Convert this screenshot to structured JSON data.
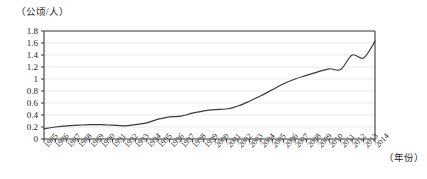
{
  "chart_data": {
    "type": "line",
    "title": "",
    "subtitle": "",
    "ylabel": "（公顷/人）",
    "xlabel": "（年份）",
    "ylim": [
      0,
      1.8
    ],
    "ytick_labels": [
      "0",
      "0.2",
      "0.4",
      "0.6",
      "0.8",
      "1",
      "1.2",
      "1.4",
      "1.6",
      "1.8"
    ],
    "ytick_values": [
      0,
      0.2,
      0.4,
      0.6,
      0.8,
      1.0,
      1.2,
      1.4,
      1.6,
      1.8
    ],
    "grid": true,
    "legend": "none",
    "categories": [
      "1985",
      "1986",
      "1987",
      "1988",
      "1989",
      "1990",
      "1991",
      "1992",
      "1993",
      "1994",
      "1995",
      "1996",
      "1997",
      "1998",
      "1999",
      "2000",
      "2001",
      "2002",
      "2003",
      "2004",
      "2005",
      "2006",
      "2007",
      "2008",
      "2009",
      "2010",
      "2011",
      "2012",
      "2013",
      "2014"
    ],
    "series": [
      {
        "name": "人均建设用地",
        "color": "#3a3a3a",
        "values": [
          0.17,
          0.2,
          0.22,
          0.23,
          0.24,
          0.24,
          0.23,
          0.22,
          0.24,
          0.27,
          0.33,
          0.37,
          0.38,
          0.43,
          0.47,
          0.49,
          0.5,
          0.55,
          0.63,
          0.72,
          0.82,
          0.92,
          1.0,
          1.06,
          1.12,
          1.17,
          1.16,
          1.4,
          1.35,
          1.63
        ]
      }
    ],
    "peak_value": 1.7,
    "end_value": 1.6,
    "start_value": 0.17
  },
  "axes": {
    "y_axis_name": "y-axis",
    "x_axis_name": "x-axis"
  },
  "colors": {
    "line": "#3a3a3a",
    "grid": "#e8e8e8",
    "axis": "#3a3a3a",
    "text": "#1a1a1a",
    "background": "#ffffff"
  }
}
